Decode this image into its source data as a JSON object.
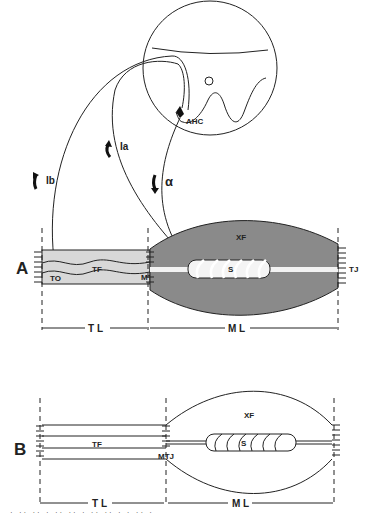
{
  "panel_a": {
    "label": "A",
    "spinal_cord": {
      "cell_label": "AHC"
    },
    "pathways": {
      "ib": "Ib",
      "ia": "Ia",
      "alpha": "α"
    },
    "labels": {
      "tf": "TF",
      "to": "TO",
      "mtj": "MTJ",
      "xf": "XF",
      "s": "S",
      "tj": "TJ"
    },
    "dims": {
      "tl": "T L",
      "ml": "M L"
    }
  },
  "panel_b": {
    "label": "B",
    "labels": {
      "tf": "TF",
      "mtj": "MTJ",
      "xf": "XF",
      "s": "S"
    },
    "dims": {
      "tl": "T L",
      "ml": "M L"
    }
  },
  "colors": {
    "muscle_fill": "#8a8a8a",
    "tendon_fill": "#d8d8d8",
    "line": "#222222"
  },
  "caption": "· ·· ·· · ·· ·· · ·· ·· · · ·· ·"
}
